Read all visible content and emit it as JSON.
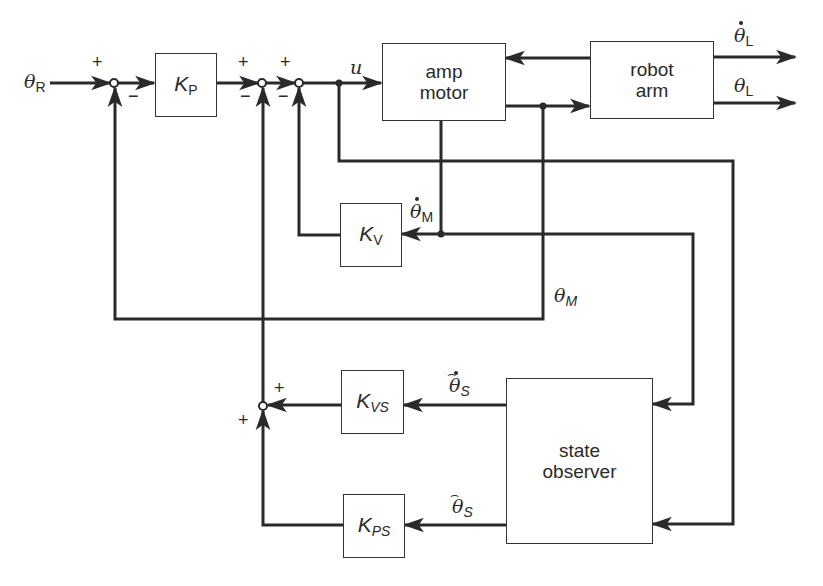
{
  "diagram": {
    "type": "control-system-block-diagram",
    "blocks": [
      {
        "id": "kp",
        "label": "K",
        "subscript": "P"
      },
      {
        "id": "amp_motor",
        "label": "amp\nmotor"
      },
      {
        "id": "robot_arm",
        "label": "robot\narm"
      },
      {
        "id": "kv",
        "label": "K",
        "subscript": "V"
      },
      {
        "id": "kvs",
        "label": "K",
        "subscript": "VS"
      },
      {
        "id": "kps",
        "label": "K",
        "subscript": "PS"
      },
      {
        "id": "state_observer",
        "label": "state\nobserver"
      }
    ],
    "signals": {
      "theta_r": {
        "symbol": "θ",
        "subscript": "R"
      },
      "u": {
        "symbol": "u"
      },
      "theta_l_dot": {
        "symbol": "θ",
        "subscript": "L",
        "accent": "dot"
      },
      "theta_l": {
        "symbol": "θ",
        "subscript": "L"
      },
      "theta_m_dot": {
        "symbol": "θ",
        "subscript": "M",
        "accent": "dot"
      },
      "theta_m": {
        "symbol": "θ",
        "subscript": "M"
      },
      "theta_s_hat_dot": {
        "symbol": "θ",
        "subscript": "S",
        "accent": "hat-dot"
      },
      "theta_s_hat": {
        "symbol": "θ",
        "subscript": "S",
        "accent": "hat"
      }
    },
    "summing_junctions": [
      {
        "id": "sum1",
        "signs": {
          "top": "+",
          "bottom": "−"
        }
      },
      {
        "id": "sum2",
        "signs": {
          "top": "+",
          "bottom": "−"
        }
      },
      {
        "id": "sum3",
        "signs": {
          "top": "+",
          "bottom": "−"
        }
      },
      {
        "id": "sum4",
        "signs": {
          "top": "+",
          "left": "+"
        }
      }
    ],
    "connections": [
      "θR → sum1(+)",
      "sum1 → KP",
      "KP → sum2(+)",
      "sum2 → sum3(+)",
      "sum3 → u → amp motor",
      "robot arm → amp motor (feedback)",
      "amp motor → robot arm",
      "robot arm → θ̇L",
      "robot arm → θL",
      "amp motor → θ̇M → KV → sum3(−)",
      "amp motor output θM → sum1(−)",
      "θ̇M → state observer",
      "u → state observer",
      "state observer → θ̂̇S → KVS → sum4(+)",
      "state observer → θ̂S → KPS → sum4(+)",
      "sum4 → sum2(−)"
    ]
  },
  "style": {
    "line_color": "#2a2a2a",
    "background": "#ffffff"
  }
}
